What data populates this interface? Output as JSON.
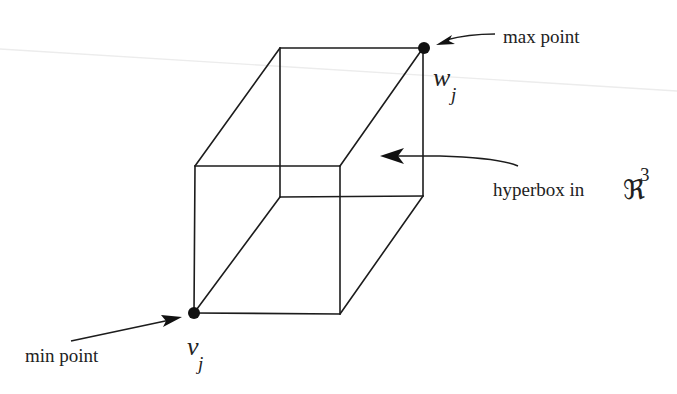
{
  "diagram": {
    "type": "hyperbox-illustration",
    "labels": {
      "max_point": "max point",
      "min_point": "min point",
      "hyperbox": "hyperbox in",
      "space_symbol": "ℜ",
      "space_dim": "3",
      "max_var": "w",
      "max_sub": "j",
      "min_var": "v",
      "min_sub": "j"
    },
    "vertices": {
      "back_top_left": [
        280,
        48
      ],
      "back_top_right_max": [
        423,
        48
      ],
      "back_bottom_left": [
        280,
        197
      ],
      "back_bottom_right": [
        423,
        196
      ],
      "front_top_left": [
        195,
        166
      ],
      "front_top_right": [
        340,
        166
      ],
      "front_bottom_left_min": [
        194,
        313
      ],
      "front_bottom_right": [
        340,
        314
      ]
    },
    "colors": {
      "ink": "#1c1c1c",
      "background": "#ffffff",
      "scan_line": "#ececec"
    }
  }
}
